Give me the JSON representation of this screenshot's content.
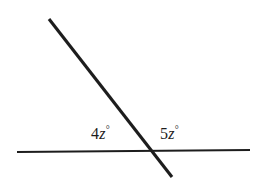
{
  "figure": {
    "type": "geometry-diagram",
    "background_color": "#ffffff",
    "stroke_color": "#1d1d1d",
    "width": 258,
    "height": 188,
    "lines": [
      {
        "name": "horizontal-line",
        "x1": 17,
        "y1": 152,
        "x2": 250,
        "y2": 150,
        "stroke_width": 2.2
      },
      {
        "name": "transversal-line",
        "x1": 49,
        "y1": 19,
        "x2": 172,
        "y2": 177,
        "stroke_width": 3.1
      }
    ],
    "intersection": {
      "x": 152,
      "y": 151
    }
  },
  "labels": {
    "left": {
      "name": "angle-label-left",
      "coefficient": "4",
      "variable": "z",
      "degree": "°",
      "full_text": "4z°",
      "x": 91,
      "y": 126
    },
    "right": {
      "name": "angle-label-right",
      "coefficient": "5",
      "variable": "z",
      "degree": "°",
      "full_text": "5z°",
      "x": 160,
      "y": 126
    }
  }
}
